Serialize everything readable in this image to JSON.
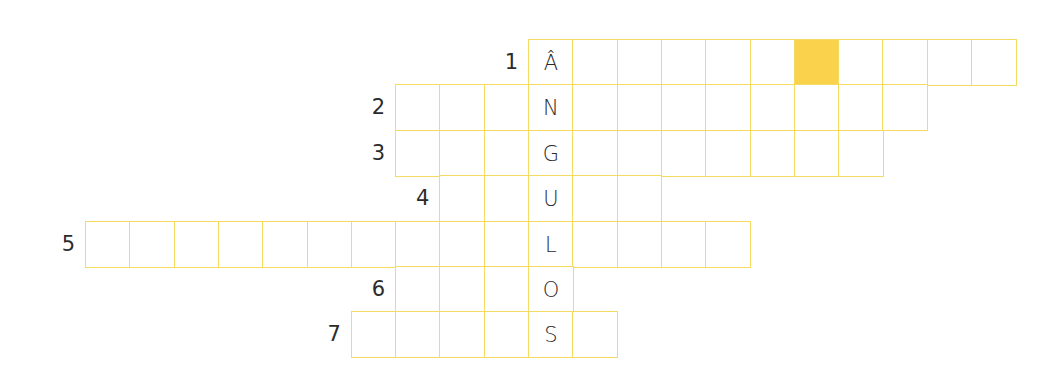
{
  "puzzle": {
    "type": "crossword",
    "keyword_vertical": "ÂNGULOS",
    "colors": {
      "grid_line": "#F4DC63",
      "highlight": "#FAD24C",
      "text": "#2b2b2b"
    },
    "grid": {
      "origin_x": 85,
      "col_width": 44.3,
      "row_tops": [
        39,
        84,
        130,
        175,
        221,
        266,
        311
      ],
      "row_height": 45.5,
      "key_col": 10
    },
    "rows": [
      {
        "number": "1",
        "start_col": 10,
        "length": 11,
        "letters": {
          "0": "Â"
        },
        "shaded": [
          6
        ]
      },
      {
        "number": "2",
        "start_col": 7,
        "length": 12,
        "letters": {
          "3": "N"
        },
        "shaded": []
      },
      {
        "number": "3",
        "start_col": 7,
        "length": 11,
        "letters": {
          "3": "G"
        },
        "shaded": []
      },
      {
        "number": "4",
        "start_col": 8,
        "length": 5,
        "letters": {
          "2": "U"
        },
        "shaded": []
      },
      {
        "number": "5",
        "start_col": 0,
        "length": 15,
        "letters": {
          "10": "L"
        },
        "shaded": []
      },
      {
        "number": "6",
        "start_col": 7,
        "length": 4,
        "letters": {
          "3": "O"
        },
        "shaded": []
      },
      {
        "number": "7",
        "start_col": 6,
        "length": 6,
        "letters": {
          "4": "S"
        },
        "shaded": []
      }
    ]
  }
}
